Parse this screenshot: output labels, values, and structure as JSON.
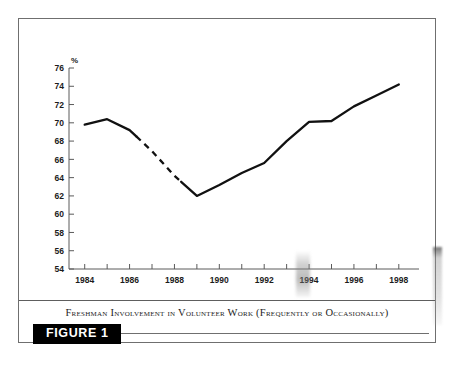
{
  "figure": {
    "caption": "Freshman Involvement in Volunteer Work (Frequently or Occasionally)",
    "label": "FIGURE 1"
  },
  "chart_data": {
    "type": "line",
    "title": "Freshman Involvement in Volunteer Work (Frequently or Occasionally)",
    "xlabel": "",
    "ylabel": "%",
    "y_unit_label": "%",
    "x": [
      1984,
      1985,
      1986,
      1987,
      1988,
      1989,
      1990,
      1991,
      1992,
      1993,
      1994,
      1995,
      1996,
      1997,
      1998
    ],
    "values": [
      69.8,
      70.4,
      69.2,
      66.9,
      64.2,
      62.0,
      63.2,
      64.5,
      65.6,
      68.0,
      70.1,
      70.2,
      71.8,
      73.0,
      74.2
    ],
    "series": [
      {
        "name": "Freshman involvement in volunteer work",
        "values": [
          69.8,
          70.4,
          69.2,
          66.9,
          64.2,
          62.0,
          63.2,
          64.5,
          65.6,
          68.0,
          70.1,
          70.2,
          71.8,
          73.0,
          74.2
        ]
      }
    ],
    "dashed_segment": {
      "note": "line drawn dashed between these x values",
      "from_x": 1986.3,
      "to_x": 1988.3
    },
    "xlim": [
      1983.3,
      1998.9
    ],
    "ylim": [
      54,
      76
    ],
    "ytick_labels": [
      "54",
      "56",
      "58",
      "60",
      "62",
      "64",
      "66",
      "68",
      "70",
      "72",
      "74",
      "76"
    ],
    "ytick_values": [
      54,
      56,
      58,
      60,
      62,
      64,
      66,
      68,
      70,
      72,
      74,
      76
    ],
    "xtick_labels": [
      "1984",
      "1986",
      "1988",
      "1990",
      "1992",
      "1994",
      "1996",
      "1998"
    ],
    "xtick_values": [
      1984,
      1986,
      1988,
      1990,
      1992,
      1994,
      1996,
      1998
    ],
    "x_minor_ticks": [
      1985,
      1987,
      1989,
      1991,
      1993,
      1995,
      1997
    ],
    "grid": false,
    "legend": "none",
    "line_color": "#111111",
    "axis_color": "#5a5a5a"
  }
}
